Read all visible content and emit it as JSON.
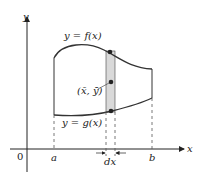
{
  "diagram": {
    "axes": {
      "y_label": "y",
      "x_label": "x",
      "origin_label": "0"
    },
    "ticks": {
      "a": "a",
      "b": "b",
      "dx": "dx"
    },
    "curves": {
      "upper_label": "y = f(x)",
      "lower_label": "y = g(x)"
    },
    "centroid_label": "(x̄, ȳ)",
    "colors": {
      "curve": "#333333",
      "strip_fill": "#d9d9d9",
      "axis": "#222222",
      "dashed": "#555555"
    }
  }
}
